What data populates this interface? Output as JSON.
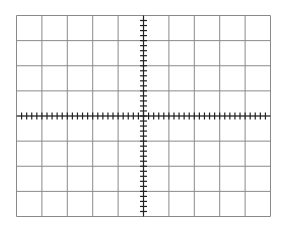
{
  "graticule": {
    "columns": 10,
    "rows": 8,
    "minor_divisions_per_major": 5,
    "grid_color": "#8a8a8a",
    "axis_color": "#222222",
    "background": "#ffffff"
  }
}
